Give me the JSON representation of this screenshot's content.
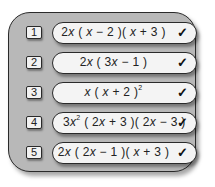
{
  "panel": {
    "rows": [
      {
        "number": "1",
        "expression_parts": [
          "2",
          "x",
          " ( ",
          "x",
          " − 2 )( ",
          "x",
          " + 3 )"
        ],
        "expression_text": "2x ( x − 2 )( x + 3 )",
        "status_icon": "check-icon",
        "status_glyph": "✓"
      },
      {
        "number": "2",
        "expression_parts": [
          "2",
          "x",
          " ( 3",
          "x",
          " − 1 )"
        ],
        "expression_text": "2x ( 3x − 1 )",
        "status_icon": "check-icon",
        "status_glyph": "✓"
      },
      {
        "number": "3",
        "expression_parts": [
          "",
          "x",
          " ( ",
          "x",
          " + 2 )",
          "2"
        ],
        "expression_text": "x ( x + 2 )²",
        "status_icon": "check-icon",
        "status_glyph": "✓"
      },
      {
        "number": "4",
        "expression_parts": [
          "3",
          "x",
          "2",
          " ( 2",
          "x",
          " + 3 )( 2",
          "x",
          " − 3 )"
        ],
        "expression_text": "3x² ( 2x + 3 )( 2x − 3 )",
        "status_icon": "check-icon",
        "status_glyph": "✓"
      },
      {
        "number": "5",
        "expression_parts": [
          "2",
          "x",
          " ( 2",
          "x",
          " − 1 )( ",
          "x",
          " + 3 )"
        ],
        "expression_text": "2x ( 2x − 1 )( x + 3 )",
        "status_icon": "check-icon",
        "status_glyph": "✓"
      }
    ]
  },
  "colors": {
    "frame_fill": "#b8b8b8",
    "pill_fill": "#f4f4f4",
    "outline": "#2a2a2a"
  }
}
